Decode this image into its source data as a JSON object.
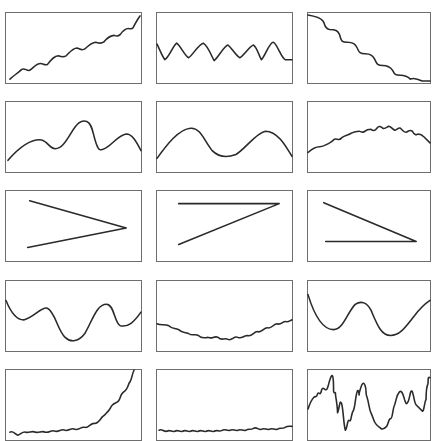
{
  "grid": {
    "rows": 5,
    "cols": 3,
    "col_x": [
      5,
      156,
      307
    ],
    "col_w": [
      137,
      137,
      124
    ],
    "row_y": [
      12,
      101,
      190,
      280,
      369
    ],
    "row_h": 72,
    "border_color": "#6e6e6e",
    "line_color": "#2a2a2a"
  },
  "panels": [
    {
      "id": "p1",
      "description": "increasing trend with small periodic wiggles"
    },
    {
      "id": "p2",
      "description": "regular oscillation then flat tail"
    },
    {
      "id": "p3",
      "description": "decreasing staircase trend"
    },
    {
      "id": "p4",
      "description": "multi-hump smooth curve with tall middle peak"
    },
    {
      "id": "p5",
      "description": "two broad humps"
    },
    {
      "id": "p6",
      "description": "gentle arch with small wiggles"
    },
    {
      "id": "p7",
      "description": "angle shape opening left (two lines meeting at right)"
    },
    {
      "id": "p8",
      "description": "horizontal line at top meeting diagonal from bottom-left"
    },
    {
      "id": "p9",
      "description": "diagonal from top-left meeting horizontal line at bottom"
    },
    {
      "id": "p10",
      "description": "smooth wave with deep trough"
    },
    {
      "id": "p11",
      "description": "shallow U-shape with small wiggles"
    },
    {
      "id": "p12",
      "description": "double-valley smooth wave"
    },
    {
      "id": "p13",
      "description": "flat wiggle then exponential rise"
    },
    {
      "id": "p14",
      "description": "flat noisy line near bottom"
    },
    {
      "id": "p15",
      "description": "highly volatile random-walk signal"
    }
  ]
}
